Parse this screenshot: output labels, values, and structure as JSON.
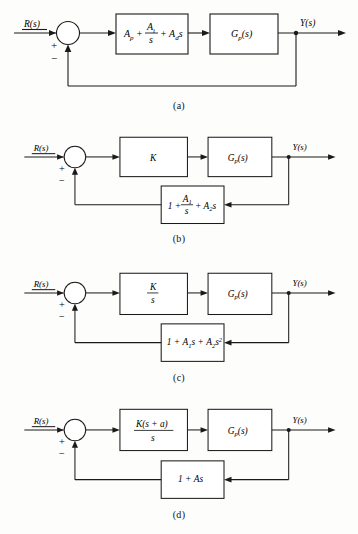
{
  "figure": {
    "input_label": "R(s)",
    "output_label": "Y(s)",
    "sum_plus": "+",
    "sum_minus": "−"
  },
  "diagrams": [
    {
      "caption": "(a)",
      "forward_blocks": [
        {
          "name": "pid-controller",
          "type": "sum-terms",
          "terms": [
            "A",
            "p"
          ],
          "text": "A_p + A_i/s + A_d s",
          "parts": {
            "t1_base": "A",
            "t1_sub": "p",
            "t2_num_base": "A",
            "t2_num_sub": "i",
            "t2_den": "s",
            "t3_base": "A",
            "t3_sub": "d",
            "t3_var": "s",
            "op1": "+",
            "op2": "+"
          }
        },
        {
          "name": "plant",
          "type": "plain",
          "text": "G_p(s)",
          "parts": {
            "base": "G",
            "sub": "p",
            "arg": "(s)"
          }
        }
      ],
      "feedback": {
        "type": "unity",
        "text": ""
      }
    },
    {
      "caption": "(b)",
      "forward_blocks": [
        {
          "name": "gain",
          "type": "plain",
          "text": "K",
          "parts": {
            "base": "K"
          }
        },
        {
          "name": "plant",
          "type": "plain",
          "text": "G_p(s)",
          "parts": {
            "base": "G",
            "sub": "p",
            "arg": "(s)"
          }
        }
      ],
      "feedback": {
        "type": "block",
        "name": "feedback-compensator",
        "text": "1 + A_1/s + A_2 s",
        "parts": {
          "t1": "1",
          "op1": "+",
          "t2_num_base": "A",
          "t2_num_sub": "1",
          "t2_den": "s",
          "op2": "+",
          "t3_base": "A",
          "t3_sub": "2",
          "t3_var": "s"
        }
      }
    },
    {
      "caption": "(c)",
      "forward_blocks": [
        {
          "name": "integral-gain",
          "type": "fraction",
          "text": "K/s",
          "parts": {
            "num": "K",
            "den": "s"
          }
        },
        {
          "name": "plant",
          "type": "plain",
          "text": "G_p(s)",
          "parts": {
            "base": "G",
            "sub": "p",
            "arg": "(s)"
          }
        }
      ],
      "feedback": {
        "type": "block",
        "name": "feedback-compensator",
        "text": "1 + A_1 s + A_2 s^2",
        "parts": {
          "t1": "1",
          "op1": "+",
          "t2_base": "A",
          "t2_sub": "1",
          "t2_var": "s",
          "op2": "+",
          "t3_base": "A",
          "t3_sub": "2",
          "t3_var": "s",
          "t3_sup": "2"
        }
      }
    },
    {
      "caption": "(d)",
      "forward_blocks": [
        {
          "name": "pi-controller",
          "type": "fraction",
          "text": "K(s + a)/s",
          "parts": {
            "num_k": "K",
            "num_rest": "(s + a)",
            "den": "s"
          }
        },
        {
          "name": "plant",
          "type": "plain",
          "text": "G_p(s)",
          "parts": {
            "base": "G",
            "sub": "p",
            "arg": "(s)"
          }
        }
      ],
      "feedback": {
        "type": "block",
        "name": "feedback-compensator",
        "text": "1 + As",
        "parts": {
          "t1": "1",
          "op1": "+",
          "t2_base": "A",
          "t2_var": "s"
        }
      }
    }
  ],
  "colors": {
    "line": "#1a1a1a",
    "box_fill": "#ffffff",
    "background": "#fdfdfb"
  }
}
